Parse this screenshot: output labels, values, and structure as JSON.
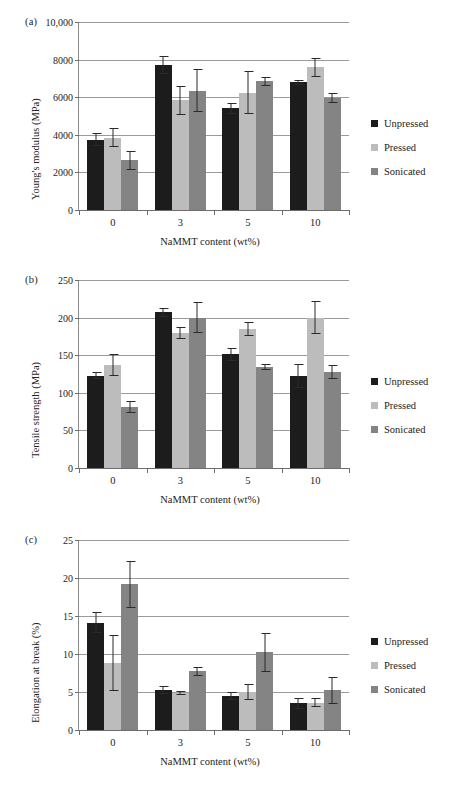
{
  "figure": {
    "series_names": [
      "Unpressed",
      "Pressed",
      "Sonicated"
    ],
    "series_colors": [
      "#1c1c1c",
      "#bcbcbc",
      "#848484"
    ],
    "categories": [
      "0",
      "3",
      "5",
      "10"
    ],
    "xlabel": "NaMMT content (wt%)"
  },
  "panels": [
    {
      "label": "(a)",
      "ylabel": "Young's modulus (MPa)",
      "xlabel": "NaMMT content (wt%)",
      "yticks": [
        "0",
        "2000",
        "4000",
        "6000",
        "8000",
        "10,000"
      ]
    },
    {
      "label": "(b)",
      "ylabel": "Tensile strength (MPa)",
      "xlabel": "NaMMT content (wt%)",
      "yticks": [
        "0",
        "50",
        "100",
        "150",
        "200",
        "250"
      ]
    },
    {
      "label": "(c)",
      "ylabel": "Elongation at break (%)",
      "xlabel": "NaMMT content (wt%)",
      "yticks": [
        "0",
        "5",
        "10",
        "15",
        "20",
        "25"
      ]
    }
  ],
  "legend": {
    "items": [
      {
        "label": "Unpressed",
        "color": "#1c1c1c"
      },
      {
        "label": "Pressed",
        "color": "#bcbcbc"
      },
      {
        "label": "Sonicated",
        "color": "#848484"
      }
    ]
  },
  "chart_data": [
    {
      "type": "bar",
      "title": "(a)",
      "xlabel": "NaMMT content (wt%)",
      "ylabel": "Young's modulus (MPa)",
      "ylim": [
        0,
        10000
      ],
      "ytick_values": [
        0,
        2000,
        4000,
        6000,
        8000,
        10000
      ],
      "ytick_labels": [
        "0",
        "2000",
        "4000",
        "6000",
        "8000",
        "10,000"
      ],
      "grid": true,
      "legend_position": "right",
      "categories": [
        "0",
        "3",
        "5",
        "10"
      ],
      "series": [
        {
          "name": "Unpressed",
          "values": [
            3750,
            7700,
            5400,
            6800
          ],
          "errors": [
            330,
            480,
            310,
            130
          ]
        },
        {
          "name": "Pressed",
          "values": [
            3850,
            5850,
            6250,
            7600
          ],
          "errors": [
            490,
            770,
            1140,
            500
          ]
        },
        {
          "name": "Sonicated",
          "values": [
            2650,
            6350,
            6850,
            5950
          ],
          "errors": [
            500,
            1130,
            230,
            280
          ]
        }
      ]
    },
    {
      "type": "bar",
      "title": "(b)",
      "xlabel": "NaMMT content (wt%)",
      "ylabel": "Tensile strength (MPa)",
      "ylim": [
        0,
        250
      ],
      "ytick_values": [
        0,
        50,
        100,
        150,
        200,
        250
      ],
      "ytick_labels": [
        "0",
        "50",
        "100",
        "150",
        "200",
        "250"
      ],
      "grid": true,
      "legend_position": "right",
      "categories": [
        "0",
        "3",
        "5",
        "10"
      ],
      "series": [
        {
          "name": "Unpressed",
          "values": [
            123,
            207,
            151,
            122
          ],
          "errors": [
            5,
            6,
            9,
            16
          ]
        },
        {
          "name": "Pressed",
          "values": [
            137,
            179,
            185,
            200
          ],
          "errors": [
            15,
            8,
            9,
            22
          ]
        },
        {
          "name": "Sonicated",
          "values": [
            81,
            200,
            134,
            128
          ],
          "errors": [
            8,
            21,
            4,
            9
          ]
        }
      ]
    },
    {
      "type": "bar",
      "title": "(c)",
      "xlabel": "NaMMT content (wt%)",
      "ylabel": "Elongation at break (%)",
      "ylim": [
        0,
        25
      ],
      "ytick_values": [
        0,
        5,
        10,
        15,
        20,
        25
      ],
      "ytick_labels": [
        "0",
        "5",
        "10",
        "15",
        "20",
        "25"
      ],
      "grid": true,
      "legend_position": "right",
      "categories": [
        "0",
        "3",
        "5",
        "10"
      ],
      "series": [
        {
          "name": "Unpressed",
          "values": [
            14.1,
            5.3,
            4.5,
            3.5
          ],
          "errors": [
            1.4,
            0.5,
            0.5,
            0.7
          ]
        },
        {
          "name": "Pressed",
          "values": [
            8.8,
            4.9,
            5.0,
            3.6
          ],
          "errors": [
            3.7,
            0.3,
            1.0,
            0.6
          ]
        },
        {
          "name": "Sonicated",
          "values": [
            19.2,
            7.7,
            10.2,
            5.2
          ],
          "errors": [
            3.1,
            0.6,
            2.6,
            1.8
          ]
        }
      ]
    }
  ]
}
